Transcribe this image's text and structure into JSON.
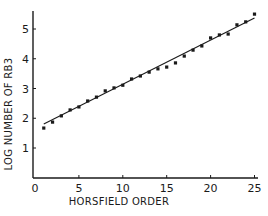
{
  "chart_data": {
    "type": "scatter",
    "title": "",
    "xlabel": "HORSFIELD ORDER",
    "ylabel": "LOG NUMBER OF RB3",
    "xlim": [
      0,
      25
    ],
    "ylim": [
      0,
      5.5
    ],
    "xticks": [
      0,
      5,
      10,
      15,
      20,
      25
    ],
    "yticks": [
      1,
      2,
      3,
      4,
      5
    ],
    "grid": false,
    "legend": null,
    "series": [
      {
        "name": "observed",
        "style": "points",
        "x": [
          1,
          2,
          3,
          4,
          5,
          6,
          7,
          8,
          9,
          10,
          11,
          12,
          13,
          14,
          15,
          16,
          17,
          18,
          19,
          20,
          21,
          22,
          23,
          24,
          25
        ],
        "y": [
          1.67,
          1.87,
          2.08,
          2.28,
          2.38,
          2.58,
          2.71,
          2.92,
          3.02,
          3.11,
          3.32,
          3.42,
          3.55,
          3.66,
          3.72,
          3.86,
          4.09,
          4.29,
          4.43,
          4.7,
          4.8,
          4.83,
          5.14,
          5.24,
          5.5
        ]
      },
      {
        "name": "regression line",
        "style": "line",
        "x": [
          1,
          25
        ],
        "y": [
          1.81,
          5.37
        ]
      }
    ]
  },
  "axes": {
    "x_tick_labels": [
      "0",
      "5",
      "10",
      "15",
      "20",
      "25"
    ],
    "y_tick_labels": [
      "1",
      "2",
      "3",
      "4",
      "5"
    ]
  },
  "colors": {
    "ink": "#1a1a1a",
    "background": "#ffffff"
  }
}
